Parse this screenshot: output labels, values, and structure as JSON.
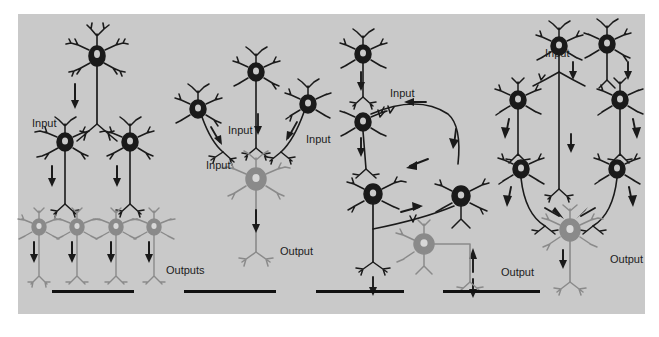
{
  "figure": {
    "background_color": "#ffffff",
    "panel_background_color": "#c9c9c9",
    "dark_neuron_color": "#1a1a1a",
    "gray_neuron_color": "#8a8a8a",
    "label_color": "#1c1c1c",
    "scalebar_color": "#111111",
    "panel_count": 4
  },
  "panels": [
    {
      "id": "panel-divergence",
      "motif": "divergence",
      "labels": [
        {
          "text": "Input",
          "x": 14,
          "y": 104
        },
        {
          "text": "Outputs",
          "x": 148,
          "y": 251
        }
      ],
      "neurons": {
        "dark": 3,
        "gray": 4
      },
      "arrows": 7,
      "scalebar": {
        "x": 34,
        "y": 276,
        "width": 82
      }
    },
    {
      "id": "panel-convergence",
      "motif": "convergence",
      "labels": [
        {
          "text": "Input",
          "x": 188,
          "y": 146
        },
        {
          "text": "Input",
          "x": 210,
          "y": 111
        },
        {
          "text": "Input",
          "x": 288,
          "y": 120
        },
        {
          "text": "Output",
          "x": 262,
          "y": 232
        }
      ],
      "neurons": {
        "dark": 3,
        "gray": 1
      },
      "arrows": 4,
      "scalebar": {
        "x": 166,
        "y": 276,
        "width": 92
      }
    },
    {
      "id": "panel-feedback",
      "motif": "feedback",
      "labels": [
        {
          "text": "Input",
          "x": 372,
          "y": 74
        },
        {
          "text": "Output",
          "x": 483,
          "y": 253
        }
      ],
      "neurons": {
        "dark": 4,
        "gray": 1
      },
      "arrows": 8,
      "scalebar": {
        "x": 298,
        "y": 276,
        "width": 88
      }
    },
    {
      "id": "panel-lateral",
      "motif": "lateral-parallel",
      "labels": [
        {
          "text": "Input",
          "x": 527,
          "y": 34
        },
        {
          "text": "Output",
          "x": 592,
          "y": 240
        }
      ],
      "neurons": {
        "dark": 6,
        "gray": 1
      },
      "arrows": 11,
      "scalebar": {
        "x": 425,
        "y": 276,
        "width": 97
      }
    }
  ]
}
